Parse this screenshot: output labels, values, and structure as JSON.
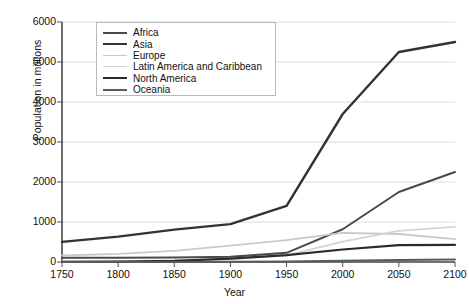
{
  "chart_data": {
    "type": "line",
    "title": "",
    "xlabel": "Year",
    "ylabel": "Population in millions",
    "x": [
      1750,
      1800,
      1850,
      1900,
      1950,
      2000,
      2050,
      2100
    ],
    "xlim": [
      1750,
      2100
    ],
    "ylim": [
      0,
      6000
    ],
    "ytick_values": [
      0,
      1000,
      2000,
      3000,
      4000,
      5000,
      6000
    ],
    "ytick_labels": [
      "0",
      "1000",
      "2000",
      "3000",
      "4000",
      "5000",
      "6000"
    ],
    "xtick_labels": [
      "1750",
      "1800",
      "1850",
      "1900",
      "1950",
      "2000",
      "2050",
      "2100"
    ],
    "grid": "horizontal",
    "legend_position": "upper-left-inside",
    "series": [
      {
        "name": "Africa",
        "color": "#4a4a4a",
        "width": 2.0,
        "values": [
          106,
          107,
          111,
          133,
          229,
          819,
          1750,
          2250
        ]
      },
      {
        "name": "Asia",
        "color": "#333333",
        "width": 2.4,
        "values": [
          502,
          635,
          809,
          947,
          1402,
          3700,
          5250,
          5500
        ]
      },
      {
        "name": "Europe",
        "color": "#c9c9c9",
        "width": 1.8,
        "values": [
          163,
          203,
          276,
          408,
          547,
          727,
          700,
          570
        ]
      },
      {
        "name": "Latin America and Caribbean",
        "color": "#d4d4d4",
        "width": 1.8,
        "values": [
          16,
          24,
          38,
          74,
          167,
          508,
          780,
          880
        ]
      },
      {
        "name": "North America",
        "color": "#2b2b2b",
        "width": 2.2,
        "values": [
          2,
          7,
          26,
          82,
          172,
          312,
          420,
          430
        ]
      },
      {
        "name": "Oceania",
        "color": "#5a5a5a",
        "width": 2.0,
        "values": [
          2,
          2,
          2,
          6,
          13,
          31,
          50,
          60
        ]
      }
    ]
  },
  "axes": {
    "x_axis_label": "Year",
    "y_axis_label": "Population in millions"
  }
}
